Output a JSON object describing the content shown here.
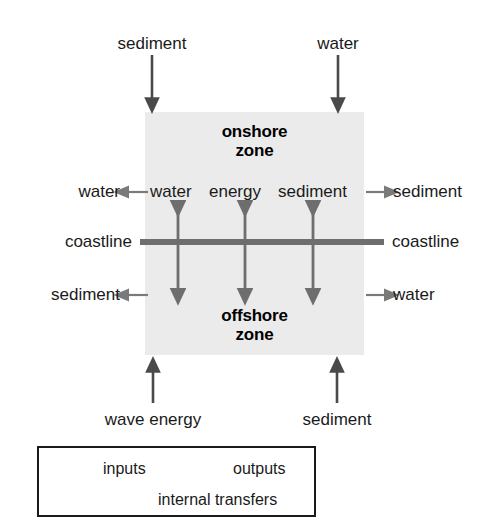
{
  "diagram": {
    "colors": {
      "zone_fill": "#ebebeb",
      "coastline": "#6e6e6e",
      "input_arrow": "#4a4a4a",
      "output_arrow": "#7a7a7a",
      "internal_arrow": "#6e6e6e",
      "text": "#1a1a1a",
      "legend_border": "#1a1a1a",
      "background": "#ffffff"
    },
    "zones": [
      {
        "id": "onshore",
        "label": "onshore\nzone",
        "line1": "onshore",
        "line2": "zone"
      },
      {
        "id": "offshore",
        "label": "offshore\nzone",
        "line1": "offshore",
        "line2": "zone"
      }
    ],
    "coastline": {
      "left_label": "coastline",
      "right_label": "coastline"
    },
    "inputs": [
      {
        "id": "top-sediment",
        "label": "sediment",
        "target_zone": "onshore",
        "direction": "down",
        "side": "top"
      },
      {
        "id": "top-water",
        "label": "water",
        "target_zone": "onshore",
        "direction": "down",
        "side": "top"
      },
      {
        "id": "bottom-wave-energy",
        "label": "wave energy",
        "target_zone": "offshore",
        "direction": "up",
        "side": "bottom"
      },
      {
        "id": "bottom-sediment",
        "label": "sediment",
        "target_zone": "offshore",
        "direction": "up",
        "side": "bottom"
      }
    ],
    "outputs": [
      {
        "id": "onshore-left-water",
        "label": "water",
        "source_zone": "onshore",
        "direction": "left",
        "side": "left"
      },
      {
        "id": "onshore-right-sediment",
        "label": "sediment",
        "source_zone": "onshore",
        "direction": "right",
        "side": "right"
      },
      {
        "id": "offshore-left-sediment",
        "label": "sediment",
        "source_zone": "offshore",
        "direction": "left",
        "side": "left"
      },
      {
        "id": "offshore-right-water",
        "label": "water",
        "source_zone": "offshore",
        "direction": "right",
        "side": "right"
      }
    ],
    "internal_transfers": [
      {
        "id": "transfer-water",
        "label": "water"
      },
      {
        "id": "transfer-energy",
        "label": "energy"
      },
      {
        "id": "transfer-sediment",
        "label": "sediment"
      }
    ],
    "internal_transfer_row_text": "water energy sediment",
    "legend": {
      "items": [
        {
          "id": "inputs",
          "label": "inputs",
          "arrow": "right-arrow-thick"
        },
        {
          "id": "outputs",
          "label": "outputs",
          "arrow": "right-arrow-thin"
        },
        {
          "id": "internal-transfers",
          "label": "internal transfers",
          "arrow": "double-headed-arrow"
        }
      ]
    }
  }
}
